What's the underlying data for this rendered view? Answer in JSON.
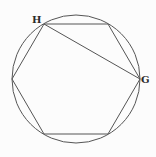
{
  "diagram": {
    "stroke_color": "#555555",
    "circle": {
      "cx": 76,
      "cy": 79,
      "r": 64
    },
    "hexagon": {
      "vertices": [
        {
          "name": "H",
          "x": 44,
          "y": 24
        },
        {
          "name": "top-right",
          "x": 108,
          "y": 24
        },
        {
          "name": "G",
          "x": 140,
          "y": 79
        },
        {
          "name": "bottom-right",
          "x": 108,
          "y": 134
        },
        {
          "name": "bottom-left",
          "x": 44,
          "y": 134
        },
        {
          "name": "left",
          "x": 12,
          "y": 79
        }
      ]
    },
    "diagonal": {
      "from": "H",
      "to": "G"
    },
    "labels": {
      "H": "H",
      "G": "G"
    }
  }
}
